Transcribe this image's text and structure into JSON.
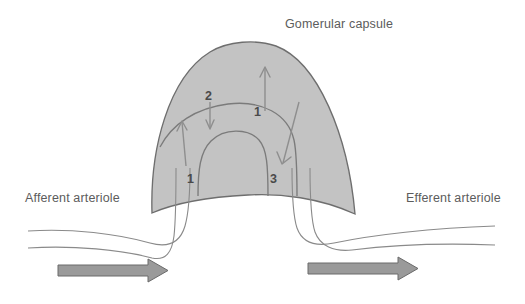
{
  "diagram": {
    "title": "Gomerular capsule",
    "canvas": {
      "width": 525,
      "height": 304,
      "background": "#ffffff"
    },
    "labels": {
      "capsule": "Gomerular capsule",
      "afferent": "Afferent arteriole",
      "efferent": "Efferent arteriole"
    },
    "markers": {
      "left_lower": "1",
      "upper_left": "2",
      "center": "1",
      "right_lower": "3"
    },
    "colors": {
      "capsule_fill": "#c3c3c3",
      "capsule_stroke": "#6e6e6e",
      "vessel_stroke": "#8a8a8a",
      "capillary_stroke": "#7b7b7b",
      "flow_arrow": "#8e8e8e",
      "block_arrow_fill": "#9a9a9a",
      "block_arrow_stroke": "#6a6a6a",
      "label_text": "#5c5c5c",
      "number_text": "#4a4a4a"
    },
    "flow_arrows": [
      {
        "name": "filtration-up-left",
        "direction": "up",
        "from": [
          186,
          165
        ],
        "to": [
          182,
          122
        ]
      },
      {
        "name": "reabsorption-down",
        "direction": "down",
        "from": [
          210,
          103
        ],
        "to": [
          210,
          128
        ]
      },
      {
        "name": "filtration-up-center",
        "direction": "up",
        "from": [
          265,
          110
        ],
        "to": [
          265,
          68
        ]
      },
      {
        "name": "secretion-down-diagonal",
        "direction": "down-left",
        "from": [
          298,
          103
        ],
        "to": [
          283,
          163
        ]
      }
    ],
    "block_arrows": [
      {
        "name": "afferent-blood-flow",
        "direction": "right",
        "x": 58,
        "y": 270,
        "length": 108
      },
      {
        "name": "efferent-blood-flow",
        "direction": "right",
        "x": 308,
        "y": 268,
        "length": 108
      }
    ]
  }
}
